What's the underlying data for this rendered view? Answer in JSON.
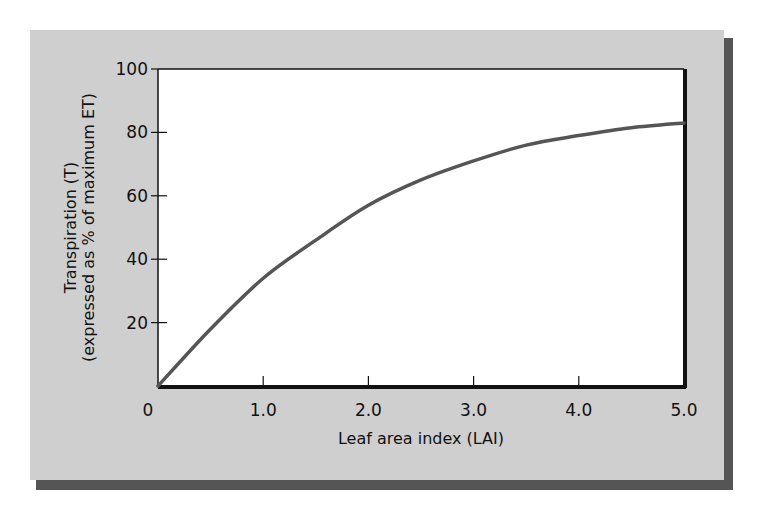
{
  "chart_data": {
    "type": "line",
    "title": "",
    "xlabel": "Leaf area index (LAI)",
    "ylabel_line1": "Transpiration (T)",
    "ylabel_line2": "(expressed as % of maximum ET)",
    "xlim": [
      0,
      5.0
    ],
    "ylim": [
      0,
      100
    ],
    "x_ticks": [
      "0",
      "1.0",
      "2.0",
      "3.0",
      "4.0",
      "5.0"
    ],
    "y_ticks": [
      "20",
      "40",
      "60",
      "80",
      "100"
    ],
    "grid": false,
    "legend": "none",
    "series": [
      {
        "name": "Transpiration",
        "x": [
          0,
          0.5,
          1.0,
          1.5,
          2.0,
          2.5,
          3.0,
          3.5,
          4.0,
          4.5,
          5.0
        ],
        "values": [
          0,
          18,
          34,
          46,
          57,
          65,
          71,
          76,
          79,
          81.5,
          83
        ],
        "color": "#555555"
      }
    ]
  },
  "colors": {
    "panel": "#cfcfcf",
    "shadow": "#555555",
    "plot_bg": "#ffffff",
    "axis": "#111111"
  }
}
